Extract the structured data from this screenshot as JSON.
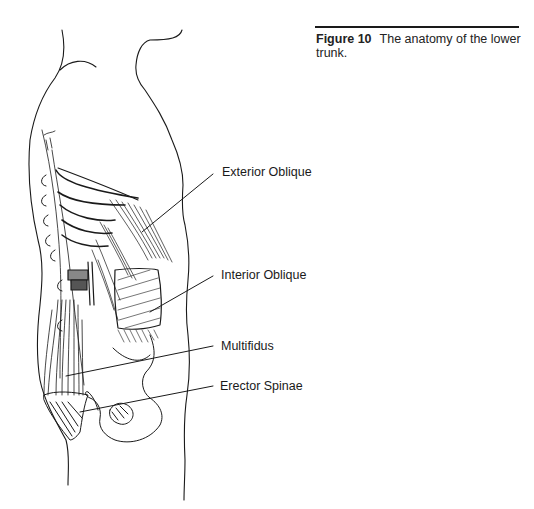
{
  "figure": {
    "number": "Figure 10",
    "caption": "The anatomy of the lower trunk."
  },
  "labels": [
    {
      "id": "exterior-oblique",
      "text": "Exterior Oblique"
    },
    {
      "id": "interior-oblique",
      "text": "Interior Oblique"
    },
    {
      "id": "multifidus",
      "text": "Multifidus"
    },
    {
      "id": "erector-spinae",
      "text": "Erector Spinae"
    }
  ],
  "illustration": {
    "subject": "lateral view of lower trunk musculature",
    "style": "black line drawing",
    "stroke_color": "#1a1a1a"
  }
}
